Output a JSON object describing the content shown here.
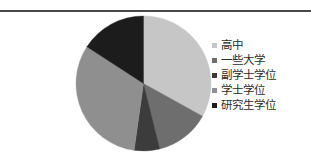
{
  "figure": {
    "background_color": "#ffffff",
    "rule_color": "#4a4a4a"
  },
  "legend": {
    "position": "right",
    "items": [
      {
        "label": "高中",
        "color": "#c6c6c6"
      },
      {
        "label": "一些大学",
        "color": "#6e6e6e"
      },
      {
        "label": "副学士学位",
        "color": "#3c3c3c"
      },
      {
        "label": "学士学位",
        "color": "#8f8f8f"
      },
      {
        "label": "研究生学位",
        "color": "#1c1c1c"
      }
    ]
  },
  "chart_data": {
    "type": "pie",
    "title": "",
    "subtitle": "",
    "xlabel": "",
    "ylabel": "",
    "grid": false,
    "legend_position": "right",
    "start_angle_deg": 0,
    "direction": "clockwise",
    "center": {
      "x": 143,
      "y": 83
    },
    "radius": 68,
    "categories": [
      "高中",
      "一些大学",
      "副学士学位",
      "学士学位",
      "研究生学位"
    ],
    "values": [
      33,
      13,
      6,
      32,
      16
    ],
    "colors": [
      "#c6c6c6",
      "#6e6e6e",
      "#3c3c3c",
      "#8f8f8f",
      "#1c1c1c"
    ],
    "slices": [
      {
        "label": "高中",
        "value": 33,
        "start_deg": 0,
        "end_deg": 119,
        "color": "#c6c6c6"
      },
      {
        "label": "一些大学",
        "value": 13,
        "start_deg": 119,
        "end_deg": 166,
        "color": "#6e6e6e"
      },
      {
        "label": "副学士学位",
        "value": 6,
        "start_deg": 166,
        "end_deg": 188,
        "color": "#3c3c3c"
      },
      {
        "label": "学士学位",
        "value": 32,
        "start_deg": 188,
        "end_deg": 303,
        "color": "#8f8f8f"
      },
      {
        "label": "研究生学位",
        "value": 16,
        "start_deg": 303,
        "end_deg": 360,
        "color": "#1c1c1c"
      }
    ]
  }
}
